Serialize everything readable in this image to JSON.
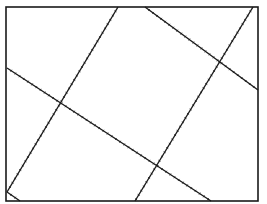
{
  "diagram": {
    "background": "#ffffff",
    "stroke_color": "#1a1a1a",
    "frame": {
      "x": 6,
      "y": 7,
      "width": 252,
      "height": 194,
      "stroke_width": 1.6
    },
    "lines": [
      {
        "id": "line-1",
        "x1": 118,
        "y1": 7,
        "x2": 7,
        "y2": 192,
        "ticked": true
      },
      {
        "id": "line-2",
        "x1": 253,
        "y1": 7,
        "x2": 135,
        "y2": 201,
        "ticked": true
      },
      {
        "id": "line-3",
        "x1": 145,
        "y1": 7,
        "x2": 258,
        "y2": 90,
        "ticked": true
      },
      {
        "id": "line-4",
        "x1": 7,
        "y1": 68,
        "x2": 211,
        "y2": 201,
        "ticked": true
      },
      {
        "id": "line-5",
        "x1": 7,
        "y1": 192,
        "x2": 20,
        "y2": 201,
        "ticked": true
      }
    ],
    "intersections": [
      {
        "x": 63,
        "y": 100
      },
      {
        "x": 161,
        "y": 153
      },
      {
        "x": 217,
        "y": 65
      }
    ]
  }
}
